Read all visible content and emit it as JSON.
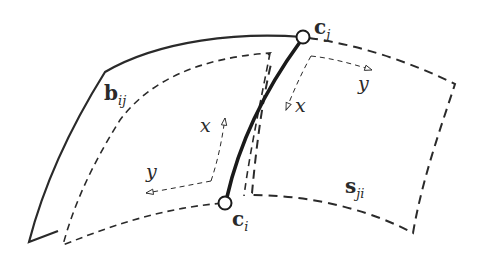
{
  "diagram": {
    "colors": {
      "stroke": "#2a2a2a",
      "background": "#ffffff"
    },
    "points": [
      {
        "id": "c_j",
        "label_main": "c",
        "label_sub": "j",
        "x": 303,
        "y": 37
      },
      {
        "id": "c_i",
        "label_main": "c",
        "label_sub": "i",
        "x": 225,
        "y": 203
      }
    ],
    "patches": [
      {
        "id": "b_ij",
        "label_main": "b",
        "label_sub": "ij",
        "style": "solid boundary / dashed interior"
      },
      {
        "id": "s_ji",
        "label_main": "s",
        "label_sub": "ji",
        "style": "dashed"
      }
    ],
    "axes": {
      "left_frame": {
        "x_label": "x",
        "y_label": "y"
      },
      "right_frame": {
        "x_label": "x",
        "y_label": "y"
      }
    }
  }
}
